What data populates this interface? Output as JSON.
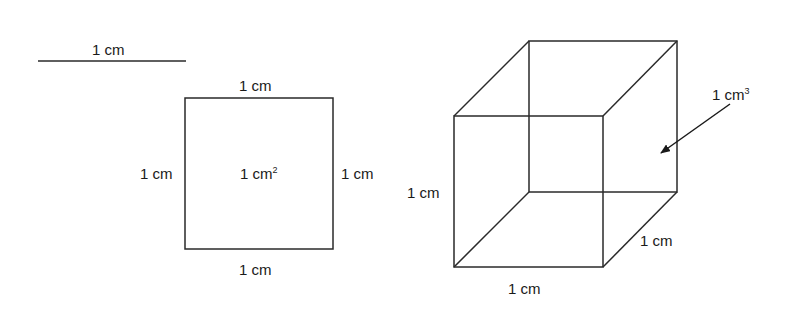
{
  "colors": {
    "stroke": "#2a2a2a",
    "text": "#1a1a1a",
    "background": "#ffffff"
  },
  "line": {
    "label": "1 cm",
    "x1": 38,
    "x2": 186,
    "y": 61
  },
  "square": {
    "x": 185,
    "y": 98,
    "size": 148,
    "labels": {
      "top": "1 cm",
      "bottom": "1 cm",
      "left": "1 cm",
      "right": "1 cm",
      "area_base": "1 cm",
      "area_exp": "2"
    }
  },
  "cube": {
    "front": {
      "x": 454,
      "y": 116,
      "size": 149
    },
    "back": {
      "x": 529,
      "y": 41,
      "size": 148
    },
    "labels": {
      "height": "1 cm",
      "width": "1 cm",
      "depth": "1 cm",
      "volume_base": "1 cm",
      "volume_exp": "3"
    },
    "arrow": {
      "x1": 730,
      "y1": 104,
      "x2": 659,
      "y2": 154
    }
  }
}
